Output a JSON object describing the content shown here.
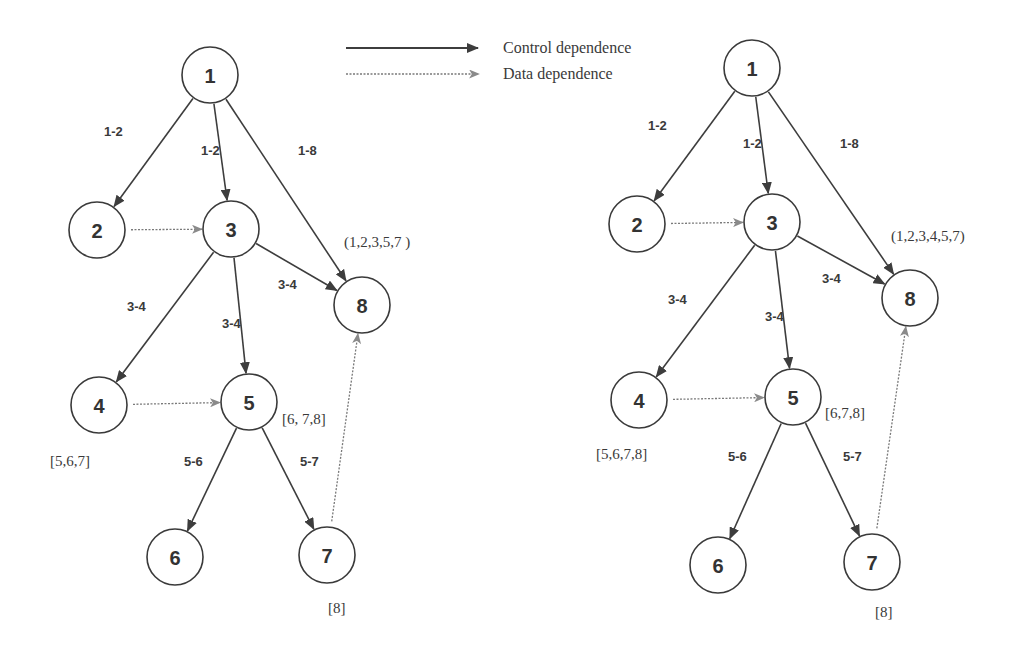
{
  "legend": {
    "control": {
      "label": "Control dependence",
      "style": "solid",
      "color": "#3d3d3d"
    },
    "data": {
      "label": "Data dependence",
      "style": "dotted",
      "color": "#7a7a7a"
    }
  },
  "graphs": [
    {
      "id": "left",
      "nodes": [
        {
          "id": "1",
          "label": "1",
          "x": 210,
          "y": 75
        },
        {
          "id": "2",
          "label": "2",
          "x": 97,
          "y": 230
        },
        {
          "id": "3",
          "label": "3",
          "x": 231,
          "y": 229
        },
        {
          "id": "8",
          "label": "8",
          "x": 362,
          "y": 305
        },
        {
          "id": "4",
          "label": "4",
          "x": 99,
          "y": 405
        },
        {
          "id": "5",
          "label": "5",
          "x": 249,
          "y": 402
        },
        {
          "id": "6",
          "label": "6",
          "x": 175,
          "y": 557
        },
        {
          "id": "7",
          "label": "7",
          "x": 327,
          "y": 555
        }
      ],
      "edges": [
        {
          "from": "1",
          "to": "2",
          "type": "control",
          "label": "1-2",
          "lx": 104,
          "ly": 136
        },
        {
          "from": "1",
          "to": "3",
          "type": "control",
          "label": "1-2",
          "lx": 201,
          "ly": 155
        },
        {
          "from": "1",
          "to": "8",
          "type": "control",
          "label": "1-8",
          "lx": 298,
          "ly": 155
        },
        {
          "from": "2",
          "to": "3",
          "type": "data",
          "label": ""
        },
        {
          "from": "3",
          "to": "8",
          "type": "control",
          "label": "3-4",
          "lx": 278,
          "ly": 289
        },
        {
          "from": "3",
          "to": "4",
          "type": "control",
          "label": "3-4",
          "lx": 127,
          "ly": 311
        },
        {
          "from": "3",
          "to": "5",
          "type": "control",
          "label": "3-4",
          "lx": 222,
          "ly": 328
        },
        {
          "from": "4",
          "to": "5",
          "type": "data",
          "label": ""
        },
        {
          "from": "5",
          "to": "6",
          "type": "control",
          "label": "5-6",
          "lx": 184,
          "ly": 466
        },
        {
          "from": "5",
          "to": "7",
          "type": "control",
          "label": "5-7",
          "lx": 300,
          "ly": 466
        },
        {
          "from": "7",
          "to": "8",
          "type": "data",
          "label": ""
        }
      ],
      "annotations": [
        {
          "target": "8",
          "text": "(1,2,3,5,7 )",
          "x": 344,
          "y": 247
        },
        {
          "target": "5",
          "text": "[6, 7,8]",
          "x": 282,
          "y": 424
        },
        {
          "target": "4",
          "text": "[5,6,7]",
          "x": 50,
          "y": 466
        },
        {
          "target": "7",
          "text": "[8]",
          "x": 328,
          "y": 613
        }
      ]
    },
    {
      "id": "right",
      "nodes": [
        {
          "id": "1",
          "label": "1",
          "x": 752,
          "y": 68
        },
        {
          "id": "2",
          "label": "2",
          "x": 637,
          "y": 224
        },
        {
          "id": "3",
          "label": "3",
          "x": 772,
          "y": 222
        },
        {
          "id": "8",
          "label": "8",
          "x": 910,
          "y": 298
        },
        {
          "id": "4",
          "label": "4",
          "x": 639,
          "y": 400
        },
        {
          "id": "5",
          "label": "5",
          "x": 793,
          "y": 397
        },
        {
          "id": "6",
          "label": "6",
          "x": 718,
          "y": 565
        },
        {
          "id": "7",
          "label": "7",
          "x": 872,
          "y": 562
        }
      ],
      "edges": [
        {
          "from": "1",
          "to": "2",
          "type": "control",
          "label": "1-2",
          "lx": 648,
          "ly": 130
        },
        {
          "from": "1",
          "to": "3",
          "type": "control",
          "label": "1-2",
          "lx": 743,
          "ly": 148
        },
        {
          "from": "1",
          "to": "8",
          "type": "control",
          "label": "1-8",
          "lx": 840,
          "ly": 148
        },
        {
          "from": "2",
          "to": "3",
          "type": "data",
          "label": ""
        },
        {
          "from": "3",
          "to": "8",
          "type": "control",
          "label": "3-4",
          "lx": 822,
          "ly": 283
        },
        {
          "from": "3",
          "to": "4",
          "type": "control",
          "label": "3-4",
          "lx": 668,
          "ly": 304
        },
        {
          "from": "3",
          "to": "5",
          "type": "control",
          "label": "3-4",
          "lx": 765,
          "ly": 321
        },
        {
          "from": "4",
          "to": "5",
          "type": "data",
          "label": ""
        },
        {
          "from": "5",
          "to": "6",
          "type": "control",
          "label": "5-6",
          "lx": 728,
          "ly": 461
        },
        {
          "from": "5",
          "to": "7",
          "type": "control",
          "label": "5-7",
          "lx": 843,
          "ly": 461
        },
        {
          "from": "7",
          "to": "8",
          "type": "data",
          "label": ""
        }
      ],
      "annotations": [
        {
          "target": "8",
          "text": "(1,2,3,4,5,7)",
          "x": 891,
          "y": 241
        },
        {
          "target": "5",
          "text": "[6,7,8]",
          "x": 825,
          "y": 418
        },
        {
          "target": "4",
          "text": "[5,6,7,8]",
          "x": 596,
          "y": 459
        },
        {
          "target": "7",
          "text": "[8]",
          "x": 875,
          "y": 617
        }
      ]
    }
  ]
}
